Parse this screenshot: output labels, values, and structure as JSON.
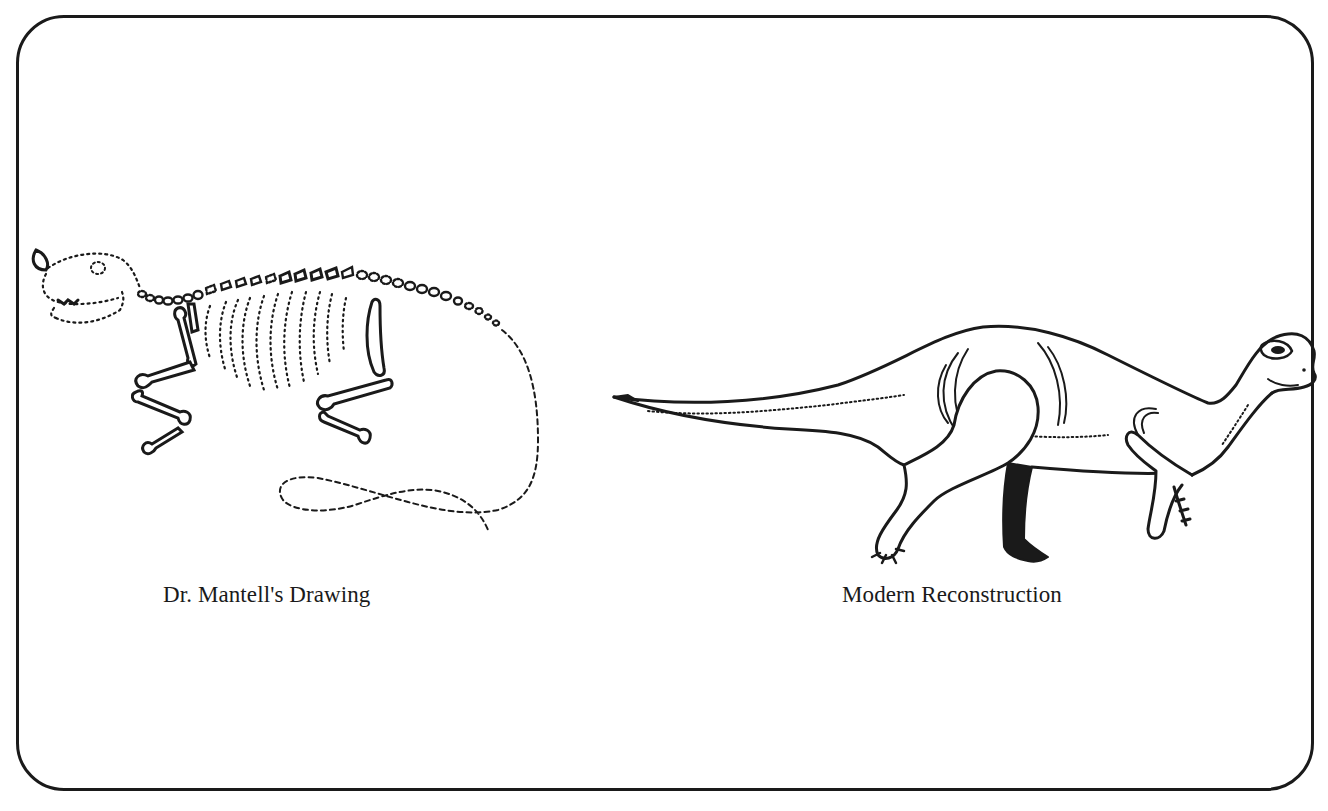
{
  "figure": {
    "panels": [
      {
        "id": "mantell",
        "caption": "Dr. Mantell's Drawing",
        "illustration": "dotted-skeleton-sketch-of-iguanodon-with-nose-horn-and-long-looping-tail"
      },
      {
        "id": "modern",
        "caption": "Modern Reconstruction",
        "illustration": "line-drawing-of-iguanodon-walking-on-hind-legs-with-stiff-tail"
      }
    ],
    "colors": {
      "ink": "#1a1a1a",
      "background": "#ffffff"
    }
  }
}
